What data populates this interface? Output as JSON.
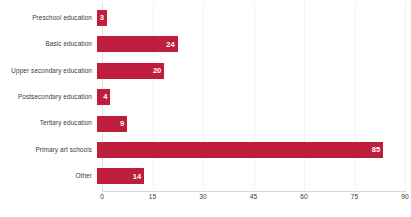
{
  "chart_data": {
    "type": "bar",
    "orientation": "horizontal",
    "title": "",
    "subtitle": "",
    "xlabel": "",
    "ylabel": "",
    "categories": [
      "Preschool education",
      "Basic education",
      "Upper secondary education",
      "Postsecondary education",
      "Tertiary education",
      "Primary art schools",
      "Other"
    ],
    "values": [
      3,
      24,
      20,
      4,
      9,
      85,
      14
    ],
    "series": [
      {
        "name": "",
        "values": [
          3,
          24,
          20,
          4,
          9,
          85,
          14
        ]
      }
    ],
    "xlim": [
      0,
      90
    ],
    "xticks": [
      0,
      15,
      30,
      45,
      60,
      75,
      90
    ],
    "xtick_labels": [
      "0",
      "15",
      "30",
      "45",
      "60",
      "75",
      "90"
    ],
    "data_labels": [
      "3",
      "24",
      "20",
      "4",
      "9",
      "85",
      "14"
    ],
    "grid": true,
    "grid_axis": "x",
    "legend": false,
    "legend_position": "none",
    "bar_color": "#be1e3c",
    "data_label_color": "#ffffff",
    "category_label_color": "#3a3a3a",
    "gridline_color": "#f2f2f2",
    "axis_line_color": "#d8d8d8",
    "background_color": "#ffffff"
  }
}
